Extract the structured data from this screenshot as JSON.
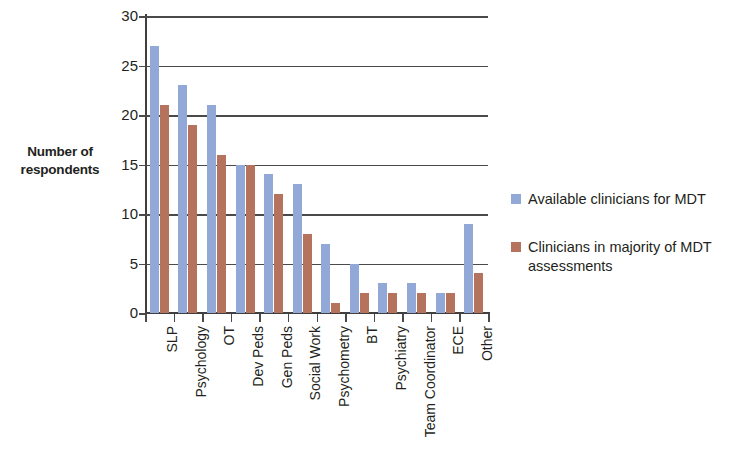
{
  "chart_data": {
    "type": "bar",
    "title": "",
    "xlabel": "",
    "ylabel": "Number of respondents",
    "ylim": [
      0,
      30
    ],
    "ytick_step": 5,
    "yticks": [
      30,
      25,
      20,
      15,
      10,
      5,
      0
    ],
    "grid": true,
    "legend_position": "right",
    "categories": [
      "SLP",
      "Psychology",
      "OT",
      "Dev Peds",
      "Gen Peds",
      "Social Work",
      "Psychometry",
      "BT",
      "Psychiatry",
      "Team Coordinator",
      "ECE",
      "Other"
    ],
    "series": [
      {
        "name": "Available clinicians for MDT",
        "color": "#92a9d7",
        "values": [
          27,
          23,
          21,
          15,
          14,
          13,
          7,
          5,
          3,
          3,
          2,
          9
        ]
      },
      {
        "name": "Clinicians in majority of MDT assessments",
        "color": "#b5725c",
        "values": [
          21,
          19,
          16,
          15,
          12,
          8,
          1,
          2,
          2,
          2,
          2,
          4
        ]
      }
    ]
  },
  "axis": {
    "y_title_line1": "Number of",
    "y_title_line2": "respondents"
  },
  "legend": {
    "entries": [
      {
        "label": "Available clinicians for MDT",
        "color": "#92a9d7"
      },
      {
        "label": "Clinicians in majority of MDT assessments",
        "color": "#b5725c"
      }
    ]
  }
}
